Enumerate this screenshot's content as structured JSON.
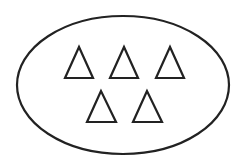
{
  "diagram": {
    "type": "set",
    "background": "#ffffff",
    "stroke_color": "#222222",
    "container": {
      "shape": "ellipse",
      "cx": 123,
      "cy": 85,
      "rx": 106,
      "ry": 69
    },
    "elements": [
      {
        "shape": "triangle",
        "row": 1,
        "apex": [
          79,
          47
        ],
        "left": [
          65,
          78
        ],
        "right": [
          93,
          78
        ]
      },
      {
        "shape": "triangle",
        "row": 1,
        "apex": [
          124,
          47
        ],
        "left": [
          110,
          78
        ],
        "right": [
          138,
          78
        ]
      },
      {
        "shape": "triangle",
        "row": 1,
        "apex": [
          170,
          47
        ],
        "left": [
          156,
          78
        ],
        "right": [
          184,
          78
        ]
      },
      {
        "shape": "triangle",
        "row": 2,
        "apex": [
          101,
          91
        ],
        "left": [
          87,
          122
        ],
        "right": [
          116,
          122
        ]
      },
      {
        "shape": "triangle",
        "row": 2,
        "apex": [
          147,
          91
        ],
        "left": [
          133,
          122
        ],
        "right": [
          162,
          122
        ]
      }
    ],
    "count": 5
  }
}
